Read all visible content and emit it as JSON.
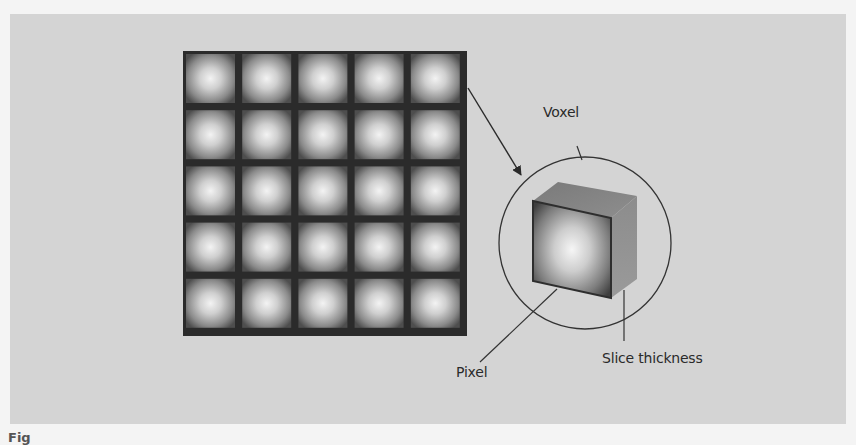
{
  "figure": {
    "labels": {
      "voxel": "Voxel",
      "pixel": "Pixel",
      "slice_thickness": "Slice thickness"
    },
    "caption_fragment": "Fig",
    "grid": {
      "rows": 5,
      "cols": 5
    },
    "colors": {
      "page_background": "#f4f4f4",
      "panel_background": "#d4d4d4",
      "grid_lines": "#2b2b2b",
      "cell_center": "#f2f2f2",
      "cell_edge": "#5a5a5a",
      "cube_side": "#8a8a8a",
      "line": "#333333"
    }
  }
}
